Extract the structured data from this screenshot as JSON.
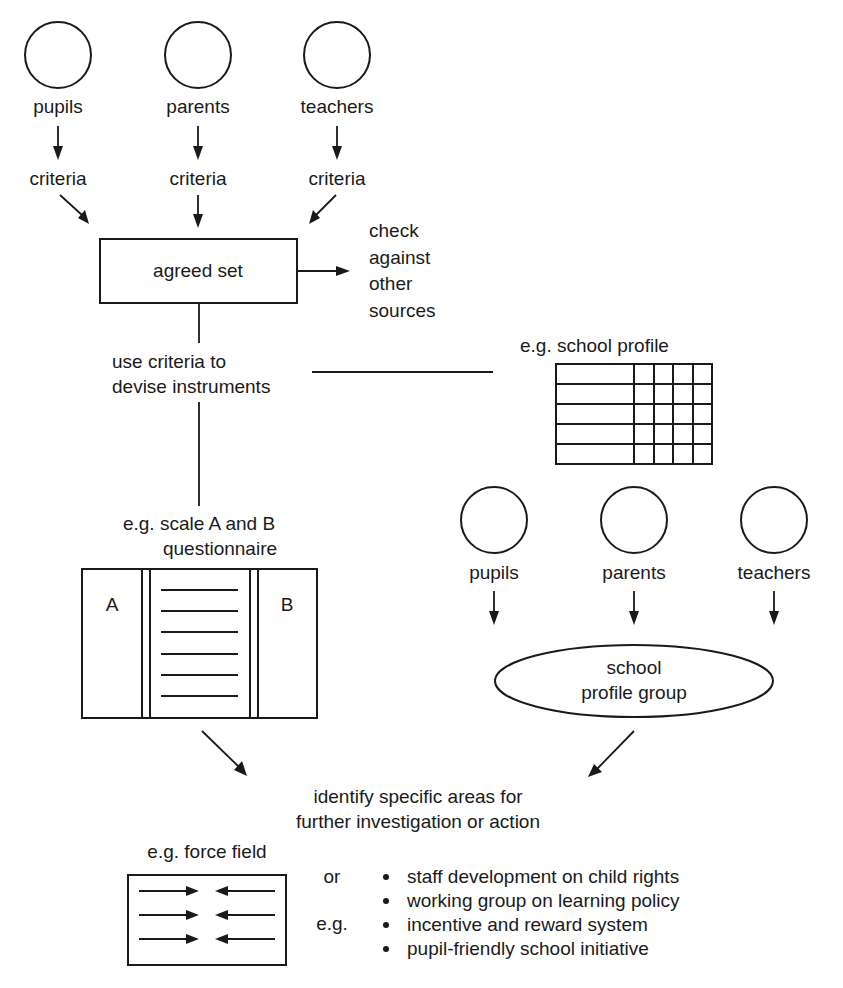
{
  "top_stakeholders": [
    {
      "label": "pupils",
      "criteria": "criteria"
    },
    {
      "label": "parents",
      "criteria": "criteria"
    },
    {
      "label": "teachers",
      "criteria": "criteria"
    }
  ],
  "agreed_set": {
    "label": "agreed set",
    "check_lines": [
      "check",
      "against",
      "other",
      "sources"
    ]
  },
  "devise": {
    "lines": [
      "use criteria to",
      "devise instruments"
    ]
  },
  "school_profile": {
    "caption": "e.g. school profile",
    "rows": 5,
    "narrow_columns": 4
  },
  "questionnaire": {
    "caption_lines": [
      "e.g. scale A and B",
      "questionnaire"
    ],
    "left_label": "A",
    "right_label": "B",
    "item_lines": 6
  },
  "bottom_stakeholders": [
    {
      "label": "pupils"
    },
    {
      "label": "parents"
    },
    {
      "label": "teachers"
    }
  ],
  "profile_group": {
    "lines": [
      "school",
      "profile group"
    ]
  },
  "identify": {
    "lines": [
      "identify specific areas for",
      "further investigation or action"
    ]
  },
  "force_field": {
    "caption": "e.g. force field",
    "arrow_rows": 3
  },
  "actions": {
    "or_label": "or",
    "eg_label": "e.g.",
    "items": [
      "staff development on child rights",
      "working group on learning policy",
      "incentive and reward system",
      "pupil-friendly school initiative"
    ]
  },
  "colors": {
    "ink": "#1a1a1a",
    "background": "#ffffff"
  }
}
